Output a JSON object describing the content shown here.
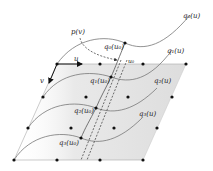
{
  "diagram": {
    "labels": {
      "q0": "q₀(u)",
      "q1": "q₁(u)",
      "q2": "q₂(u)",
      "q3": "q₃(u)",
      "q0u0": "q₀(u₀)",
      "q1u0": "q₁(u₀)",
      "q2u0": "q₂(u₀)",
      "q3u0": "q₃(u₀)",
      "p": "p(v)",
      "u": "u",
      "v": "v",
      "u0": "u₀"
    },
    "colors": {
      "shade": "#e6e6e6",
      "line": "#888888",
      "curve": "#777777",
      "point": "#111111",
      "arrow": "#111111"
    }
  }
}
